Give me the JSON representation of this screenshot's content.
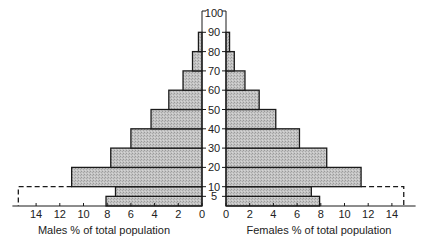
{
  "chart_data": {
    "type": "bar",
    "subtype": "population-pyramid",
    "title": "",
    "age_axis": {
      "ticks": [
        5,
        10,
        20,
        30,
        40,
        50,
        60,
        70,
        80,
        90,
        100
      ],
      "bracket_top_label": "100"
    },
    "age_groups": [
      "0-5",
      "5-10",
      "10-20",
      "20-30",
      "30-40",
      "40-50",
      "50-60",
      "60-70",
      "70-80",
      "80-90"
    ],
    "age_bounds": [
      [
        0,
        5
      ],
      [
        5,
        10
      ],
      [
        10,
        20
      ],
      [
        20,
        30
      ],
      [
        30,
        40
      ],
      [
        40,
        50
      ],
      [
        50,
        60
      ],
      [
        60,
        70
      ],
      [
        70,
        80
      ],
      [
        80,
        90
      ]
    ],
    "series": [
      {
        "name": "Males % of total population",
        "side": "left",
        "values": [
          8.1,
          7.3,
          11.0,
          7.7,
          6.0,
          4.3,
          2.8,
          1.6,
          0.8,
          0.3
        ]
      },
      {
        "name": "Females % of total population",
        "side": "right",
        "values": [
          7.9,
          7.2,
          11.4,
          8.5,
          6.2,
          4.2,
          2.8,
          1.6,
          0.7,
          0.3
        ]
      }
    ],
    "dashed_overlay": {
      "age_range": [
        0,
        10
      ],
      "male_value": 15.5,
      "female_value": 15.0
    },
    "x_left": {
      "label": "Males % of total population",
      "ticks": [
        14,
        12,
        10,
        8,
        6,
        4,
        2,
        0
      ],
      "range": [
        0,
        16
      ]
    },
    "x_right": {
      "label": "Females % of total population",
      "ticks": [
        0,
        2,
        4,
        6,
        8,
        10,
        12,
        14
      ],
      "range": [
        0,
        16
      ]
    },
    "grid": false,
    "legend": "none"
  },
  "labels": {
    "male_axis_title": "Males % of total population",
    "female_axis_title": "Females % of total population"
  },
  "colors": {
    "bar_fill": "#bdbdbd",
    "bar_stroke": "#1a1a1a",
    "axis": "#1a1a1a"
  }
}
